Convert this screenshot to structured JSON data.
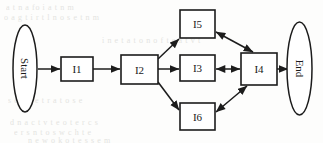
{
  "diagram": {
    "type": "flow-diagram",
    "title": "",
    "canvas": {
      "width": 323,
      "height": 143
    },
    "background": {
      "paper_color": "#fdfdfc",
      "ink_color": "#1c1c1c",
      "ghost_text_color": "#cfcfcb",
      "ghost_lines": [
        {
          "text": "a t  n  a  fo   i   a  t  n  m",
          "x": 6,
          "y": 3
        },
        {
          "text": "o  a  g   t  i   r  t  l   n  o   s e  t  n m",
          "x": 4,
          "y": 13
        },
        {
          "text": "i   n e  t  a   t  o n   o  f  t  e   a  t  v  t",
          "x": 102,
          "y": 36
        },
        {
          "text": "s  e   n   a  e   t   r  a   t   o   s   e",
          "x": 8,
          "y": 96
        },
        {
          "text": "d  n  a   c  t   v  t  e   o   t e   r  c  s",
          "x": 10,
          "y": 118
        },
        {
          "text": "e  r  s   n   t    o   s   w   c  h    t  e",
          "x": 14,
          "y": 128
        },
        {
          "text": "n  e  w   o  k   o   t  e   s  s  e  m",
          "x": 28,
          "y": 136
        }
      ]
    },
    "nodes": [
      {
        "id": "start",
        "label": "Start",
        "shape": "ellipse",
        "rotated_label": true,
        "cx": 25,
        "cy": 68.5,
        "rx": 12,
        "ry": 43.5
      },
      {
        "id": "i1",
        "label": "I1",
        "shape": "rect",
        "rotated_label": false,
        "x": 61,
        "y": 57,
        "w": 32,
        "h": 24
      },
      {
        "id": "i2",
        "label": "I2",
        "shape": "rect",
        "rotated_label": false,
        "x": 121,
        "y": 55,
        "w": 37,
        "h": 29
      },
      {
        "id": "i5",
        "label": "I5",
        "shape": "rect",
        "rotated_label": false,
        "x": 180,
        "y": 10,
        "w": 35,
        "h": 28
      },
      {
        "id": "i3",
        "label": "I3",
        "shape": "rect",
        "rotated_label": false,
        "x": 180,
        "y": 55,
        "w": 35,
        "h": 26
      },
      {
        "id": "i6",
        "label": "I6",
        "shape": "rect",
        "rotated_label": false,
        "x": 180,
        "y": 103,
        "w": 35,
        "h": 27
      },
      {
        "id": "i4",
        "label": "I4",
        "shape": "rect",
        "rotated_label": false,
        "x": 241,
        "y": 53,
        "w": 36,
        "h": 32
      },
      {
        "id": "end",
        "label": "End",
        "shape": "ellipse",
        "rotated_label": true,
        "cx": 299.5,
        "cy": 68.5,
        "rx": 12.5,
        "ry": 46.5
      }
    ],
    "edges": [
      {
        "id": "start-to-i1",
        "from": "start",
        "to": "i1",
        "direction": "forward",
        "x1": 38,
        "y1": 69,
        "x2": 60,
        "y2": 69
      },
      {
        "id": "i1-to-i2",
        "from": "i1",
        "to": "i2",
        "direction": "forward",
        "x1": 93,
        "y1": 69,
        "x2": 120,
        "y2": 69
      },
      {
        "id": "i2-to-i5",
        "from": "i2",
        "to": "i5",
        "direction": "forward",
        "x1": 158,
        "y1": 59,
        "x2": 179,
        "y2": 39
      },
      {
        "id": "i2-to-i3",
        "from": "i2",
        "to": "i3",
        "direction": "forward",
        "x1": 158,
        "y1": 69,
        "x2": 179,
        "y2": 69
      },
      {
        "id": "i2-to-i6",
        "from": "i2",
        "to": "i6",
        "direction": "forward",
        "x1": 158,
        "y1": 82,
        "x2": 179,
        "y2": 110
      },
      {
        "id": "i5-to-i4",
        "from": "i5",
        "to": "i4",
        "direction": "bidirectional",
        "x1": 216,
        "y1": 32,
        "x2": 253,
        "y2": 52
      },
      {
        "id": "i3-to-i4",
        "from": "i3",
        "to": "i4",
        "direction": "bidirectional",
        "x1": 216,
        "y1": 69,
        "x2": 240,
        "y2": 69
      },
      {
        "id": "i6-to-i4",
        "from": "i6",
        "to": "i4",
        "direction": "bidirectional",
        "x1": 216,
        "y1": 112,
        "x2": 247,
        "y2": 86
      },
      {
        "id": "i4-to-end",
        "from": "i4",
        "to": "end",
        "direction": "forward",
        "x1": 277,
        "y1": 69,
        "x2": 288,
        "y2": 69
      }
    ]
  }
}
